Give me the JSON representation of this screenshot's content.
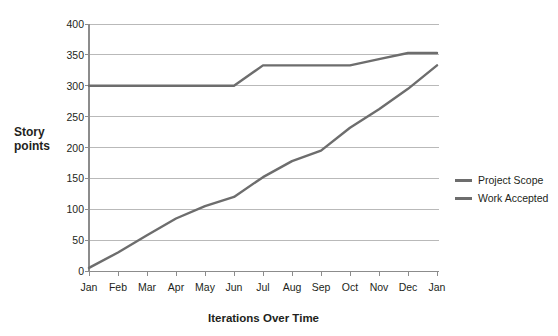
{
  "chart_data": {
    "type": "line",
    "title": "",
    "xlabel": "Iterations Over Time",
    "ylabel": "Story points",
    "categories": [
      "Jan",
      "Feb",
      "Mar",
      "Apr",
      "May",
      "Jun",
      "Jul",
      "Aug",
      "Sep",
      "Oct",
      "Nov",
      "Dec",
      "Jan"
    ],
    "ylim": [
      0,
      400
    ],
    "yticks": [
      0,
      50,
      100,
      150,
      200,
      250,
      300,
      350,
      400
    ],
    "ytick_labels": [
      "0",
      "50",
      "100",
      "150",
      "200",
      "250",
      "300",
      "350",
      "400"
    ],
    "grid": true,
    "legend_position": "right",
    "series": [
      {
        "name": "Project Scope",
        "color": "#6d6d6d",
        "values": [
          300,
          300,
          300,
          300,
          300,
          300,
          333,
          333,
          333,
          333,
          343,
          353,
          353
        ]
      },
      {
        "name": "Work Accepted",
        "color": "#6d6d6d",
        "values": [
          5,
          30,
          58,
          85,
          105,
          120,
          152,
          178,
          195,
          232,
          262,
          295,
          333
        ]
      }
    ]
  },
  "axis": {
    "y_title_line1": "Story",
    "y_title_line2": "points"
  },
  "legend": {
    "items": [
      {
        "label": "Project Scope",
        "color": "#6d6d6d"
      },
      {
        "label": "Work Accepted",
        "color": "#6d6d6d"
      }
    ]
  }
}
